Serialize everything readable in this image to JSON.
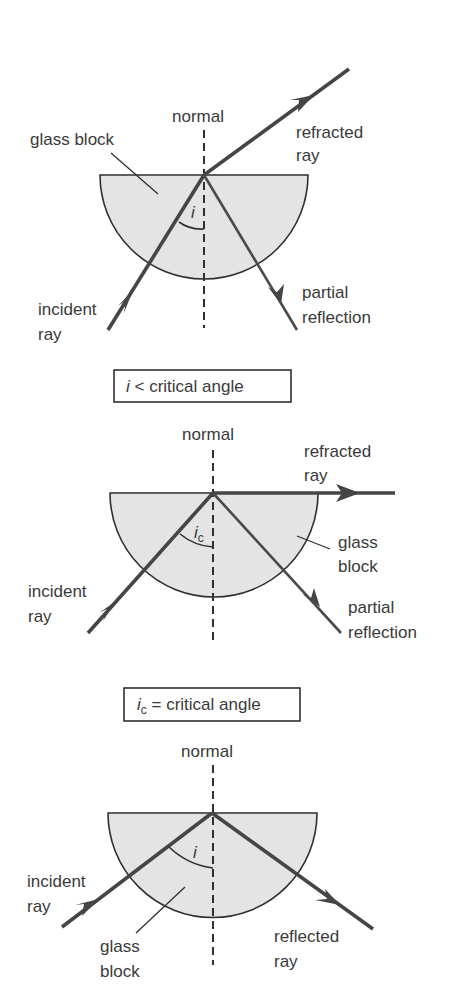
{
  "figure": {
    "colors": {
      "glass_fill": "#e4e4e4",
      "line": "#2f2f2f",
      "ray": "#454545",
      "text": "#3a3a3a"
    }
  },
  "diagram1": {
    "normal_label": "normal",
    "glass_block_label": "glass block",
    "refracted_label_line1": "refracted",
    "refracted_label_line2": "ray",
    "incident_label_line1": "incident",
    "incident_label_line2": "ray",
    "partial_label_line1": "partial",
    "partial_label_line2": "reflection",
    "angle_symbol": "i",
    "caption_symbol": "i",
    "caption_text": " < critical angle"
  },
  "diagram2": {
    "normal_label": "normal",
    "refracted_label_line1": "refracted",
    "refracted_label_line2": "ray",
    "glass_label_line1": "glass",
    "glass_label_line2": "block",
    "incident_label_line1": "incident",
    "incident_label_line2": "ray",
    "partial_label_line1": "partial",
    "partial_label_line2": "reflection",
    "angle_symbol": "i",
    "angle_subscript": "c",
    "caption_symbol": "i",
    "caption_subscript": "c",
    "caption_text": " = critical angle"
  },
  "diagram3": {
    "normal_label": "normal",
    "incident_label_line1": "incident",
    "incident_label_line2": "ray",
    "glass_label_line1": "glass",
    "glass_label_line2": "block",
    "reflected_label_line1": "reflected",
    "reflected_label_line2": "ray",
    "angle_symbol": "i"
  }
}
